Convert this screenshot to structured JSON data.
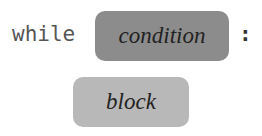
{
  "syntax": {
    "keyword": "while",
    "condition_label": "condition",
    "colon": ":",
    "block_label": "block"
  },
  "colors": {
    "condition_fill": "#8c8c8c",
    "block_fill": "#b8b8b8",
    "keyword_text": "#555555"
  }
}
